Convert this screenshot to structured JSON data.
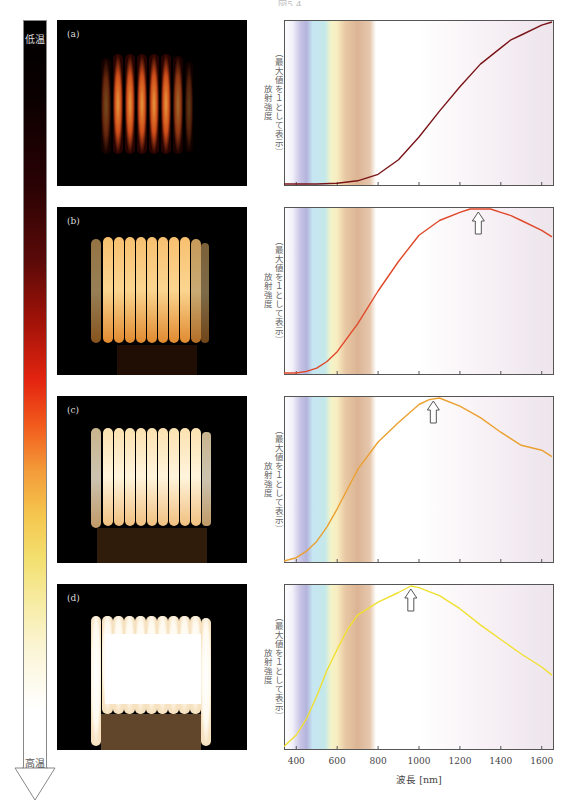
{
  "page": {
    "title": "図5.4"
  },
  "temperature_scale": {
    "low_label": "低温",
    "high_label": "高温",
    "gradient_colors": [
      "#000000",
      "#5a0a08",
      "#e32410",
      "#f39a38",
      "#f3e070",
      "#fbf5d6",
      "#ffffff"
    ]
  },
  "photos": [
    {
      "label": "(a)",
      "description": "dim red-orange glowing coil"
    },
    {
      "label": "(b)",
      "description": "orange glowing coil"
    },
    {
      "label": "(c)",
      "description": "yellow-white glowing coil"
    },
    {
      "label": "(d)",
      "description": "bright white glowing coil"
    }
  ],
  "axes": {
    "ylabel_line1": "放射強度",
    "ylabel_line2": "（最大値を１として表示）",
    "xlabel": "波長 [nm]",
    "xticks": [
      "400",
      "600",
      "800",
      "1000",
      "1200",
      "1400",
      "1600"
    ]
  },
  "chart_data": [
    {
      "type": "line",
      "panel": "(a)",
      "title": "",
      "xlabel": "波長 [nm]",
      "ylabel": "放射強度（最大値を１として表示）",
      "xlim": [
        340,
        1660
      ],
      "ylim": [
        0,
        1
      ],
      "xticks": [
        400,
        600,
        800,
        1000,
        1200,
        1400,
        1600
      ],
      "line_color": "#7a1418",
      "visible_band_nm": [
        380,
        780
      ],
      "peak_arrow_nm": null,
      "x": [
        340,
        400,
        500,
        600,
        700,
        800,
        900,
        1000,
        1100,
        1200,
        1300,
        1400,
        1450,
        1500,
        1600,
        1650
      ],
      "y": [
        0.0,
        0.0,
        0.0,
        0.005,
        0.02,
        0.06,
        0.15,
        0.29,
        0.45,
        0.6,
        0.74,
        0.84,
        0.89,
        0.92,
        0.98,
        1.0
      ]
    },
    {
      "type": "line",
      "panel": "(b)",
      "title": "",
      "xlabel": "波長 [nm]",
      "ylabel": "放射強度（最大値を１として表示）",
      "xlim": [
        340,
        1660
      ],
      "ylim": [
        0,
        1
      ],
      "xticks": [
        400,
        600,
        800,
        1000,
        1200,
        1400,
        1600
      ],
      "line_color": "#e0482a",
      "visible_band_nm": [
        380,
        780
      ],
      "peak_arrow_nm": 1290,
      "x": [
        340,
        400,
        450,
        500,
        550,
        600,
        700,
        800,
        900,
        1000,
        1100,
        1200,
        1250,
        1300,
        1350,
        1400,
        1450,
        1500,
        1600,
        1650
      ],
      "y": [
        0.0,
        0.0,
        0.01,
        0.03,
        0.07,
        0.13,
        0.3,
        0.5,
        0.68,
        0.84,
        0.93,
        0.98,
        1.0,
        1.0,
        1.0,
        0.98,
        0.96,
        0.93,
        0.87,
        0.83
      ]
    },
    {
      "type": "line",
      "panel": "(c)",
      "title": "",
      "xlabel": "波長 [nm]",
      "ylabel": "放射強度（最大値を１として表示）",
      "xlim": [
        340,
        1660
      ],
      "ylim": [
        0,
        1
      ],
      "xticks": [
        400,
        600,
        800,
        1000,
        1200,
        1400,
        1600
      ],
      "line_color": "#eba030",
      "visible_band_nm": [
        380,
        780
      ],
      "peak_arrow_nm": 1070,
      "x": [
        340,
        400,
        450,
        500,
        550,
        600,
        700,
        800,
        900,
        1000,
        1050,
        1100,
        1200,
        1300,
        1400,
        1500,
        1600,
        1650
      ],
      "y": [
        0.0,
        0.02,
        0.06,
        0.12,
        0.21,
        0.32,
        0.56,
        0.73,
        0.85,
        0.96,
        0.99,
        1.0,
        0.95,
        0.88,
        0.79,
        0.71,
        0.68,
        0.64
      ]
    },
    {
      "type": "line",
      "panel": "(d)",
      "title": "",
      "xlabel": "波長 [nm]",
      "ylabel": "放射強度（最大値を１として表示）",
      "xlim": [
        340,
        1660
      ],
      "ylim": [
        0,
        1
      ],
      "xticks": [
        400,
        600,
        800,
        1000,
        1200,
        1400,
        1600
      ],
      "line_color": "#f0e030",
      "visible_band_nm": [
        380,
        780
      ],
      "peak_arrow_nm": 960,
      "x": [
        340,
        400,
        450,
        500,
        550,
        600,
        650,
        700,
        750,
        800,
        900,
        960,
        1000,
        1100,
        1200,
        1300,
        1400,
        1500,
        1600,
        1650
      ],
      "y": [
        0.01,
        0.08,
        0.18,
        0.32,
        0.48,
        0.61,
        0.73,
        0.82,
        0.86,
        0.9,
        0.96,
        1.0,
        0.99,
        0.94,
        0.86,
        0.76,
        0.67,
        0.58,
        0.5,
        0.45
      ]
    }
  ]
}
